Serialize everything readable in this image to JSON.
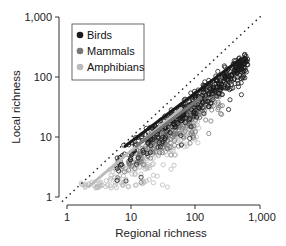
{
  "chart_data": {
    "type": "scatter",
    "title": "",
    "xlabel": "Regional richness",
    "ylabel": "Local richness",
    "xscale": "log",
    "yscale": "log",
    "xlim": [
      1,
      1000
    ],
    "ylim": [
      1,
      1000
    ],
    "xticks": [
      1,
      10,
      100,
      1000
    ],
    "xtick_labels": [
      "1",
      "10",
      "100",
      "1,000"
    ],
    "yticks": [
      1,
      10,
      100,
      1000
    ],
    "ytick_labels": [
      "1",
      "10",
      "100",
      "1,000"
    ],
    "grid": false,
    "legend_position": "upper left",
    "reference_line": {
      "label": "1:1 line",
      "style": "dotted",
      "x": [
        0.85,
        1100
      ],
      "y": [
        0.85,
        1100
      ]
    },
    "series": [
      {
        "name": "Birds",
        "color": "#1a1a1a",
        "marker": "open circle",
        "regression": {
          "x": [
            8,
            500
          ],
          "y": [
            7,
            200
          ]
        },
        "cloud": {
          "xrange": [
            5,
            650
          ],
          "slope": 0.82,
          "intercept": 0.08,
          "spread": 0.18,
          "n": 420
        }
      },
      {
        "name": "Mammals",
        "color": "#777777",
        "marker": "open circle",
        "regression": {
          "x": [
            12,
            120
          ],
          "y": [
            7,
            45
          ]
        },
        "cloud": {
          "xrange": [
            6,
            260
          ],
          "slope": 0.85,
          "intercept": -0.12,
          "spread": 0.22,
          "n": 320
        }
      },
      {
        "name": "Amphibians",
        "color": "#bbbbbb",
        "marker": "open circle",
        "regression": {
          "x": [
            2.2,
            60
          ],
          "y": [
            1.5,
            30
          ]
        },
        "cloud": {
          "xrange": [
            1.5,
            120
          ],
          "slope": 0.85,
          "intercept": -0.2,
          "spread": 0.28,
          "n": 260
        }
      }
    ]
  },
  "legend": {
    "items": [
      {
        "label": "Birds",
        "color": "#1a1a1a"
      },
      {
        "label": "Mammals",
        "color": "#777777"
      },
      {
        "label": "Amphibians",
        "color": "#bbbbbb"
      }
    ]
  }
}
